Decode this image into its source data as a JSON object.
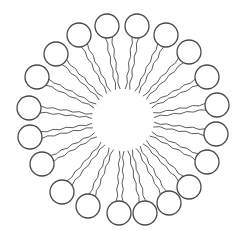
{
  "diagram": {
    "title": "",
    "type": "micelle",
    "stroke_color": "#4a4a4a",
    "background": "#ffffff",
    "center": [
      123,
      120
    ],
    "head_radius": 12,
    "inner_radius": 30,
    "heads": [
      [
        107,
        26
      ],
      [
        137,
        26
      ],
      [
        166,
        35
      ],
      [
        189,
        52
      ],
      [
        207,
        77
      ],
      [
        217,
        105
      ],
      [
        216,
        134
      ],
      [
        207,
        162
      ],
      [
        189,
        187
      ],
      [
        169,
        203
      ],
      [
        145,
        213
      ],
      [
        119,
        213
      ],
      [
        88,
        206
      ],
      [
        62,
        192
      ],
      [
        42,
        164
      ],
      [
        30,
        137
      ],
      [
        29,
        108
      ],
      [
        37,
        77
      ],
      [
        56,
        54
      ],
      [
        79,
        35
      ]
    ],
    "tails_per_head": 2
  }
}
